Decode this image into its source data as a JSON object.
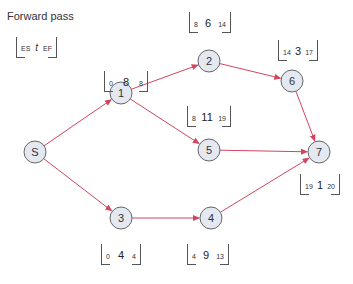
{
  "title": "Forward pass",
  "legend": {
    "es": "ES",
    "t": "t",
    "ef": "EF"
  },
  "colors": {
    "edge": "#d2455f",
    "node_fill": "#e3e8f1",
    "node_stroke": "#666666"
  },
  "nodes": [
    {
      "id": "S",
      "label": "S",
      "x": 35,
      "y": 152
    },
    {
      "id": "1",
      "label": "1",
      "x": 121,
      "y": 93
    },
    {
      "id": "2",
      "label": "2",
      "x": 209,
      "y": 61
    },
    {
      "id": "3",
      "label": "3",
      "x": 121,
      "y": 218
    },
    {
      "id": "4",
      "label": "4",
      "x": 211,
      "y": 218
    },
    {
      "id": "5",
      "label": "5",
      "x": 209,
      "y": 150
    },
    {
      "id": "6",
      "label": "6",
      "x": 292,
      "y": 81
    },
    {
      "id": "7",
      "label": "7",
      "x": 319,
      "y": 152
    }
  ],
  "edges": [
    {
      "from": "S",
      "to": "1"
    },
    {
      "from": "S",
      "to": "3"
    },
    {
      "from": "1",
      "to": "2"
    },
    {
      "from": "1",
      "to": "5"
    },
    {
      "from": "2",
      "to": "6"
    },
    {
      "from": "6",
      "to": "7"
    },
    {
      "from": "5",
      "to": "7"
    },
    {
      "from": "3",
      "to": "4"
    },
    {
      "from": "4",
      "to": "7"
    }
  ],
  "boxes": {
    "n1": {
      "es": "0",
      "t": "8",
      "ef": "8"
    },
    "n2": {
      "es": "8",
      "t": "6",
      "ef": "14"
    },
    "n6": {
      "es": "14",
      "t": "3",
      "ef": "17"
    },
    "n5": {
      "es": "8",
      "t": "11",
      "ef": "19"
    },
    "n7": {
      "es": "19",
      "t": "1",
      "ef": "20"
    },
    "n3": {
      "es": "0",
      "t": "4",
      "ef": "4"
    },
    "n4": {
      "es": "4",
      "t": "9",
      "ef": "13"
    }
  }
}
